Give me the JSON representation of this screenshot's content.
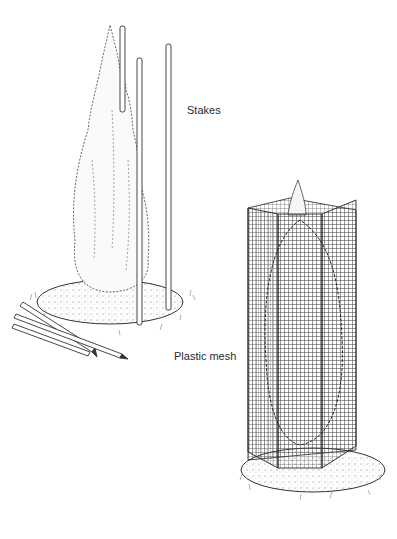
{
  "labels": {
    "stakes": "Stakes",
    "mesh": "Plastic mesh"
  },
  "illustrations": [
    {
      "name": "conifer-with-stakes",
      "parts": [
        "conifer",
        "three upright stakes",
        "two loose stakes on ground",
        "mulch ring",
        "grass tufts"
      ]
    },
    {
      "name": "conifer-in-mesh-cage",
      "parts": [
        "conifer",
        "plastic mesh cylinder",
        "mulch ring",
        "grass tufts"
      ]
    }
  ],
  "colors": {
    "ink": "#2b2b2b",
    "background": "#ffffff",
    "mesh": "#3a3a3a"
  }
}
